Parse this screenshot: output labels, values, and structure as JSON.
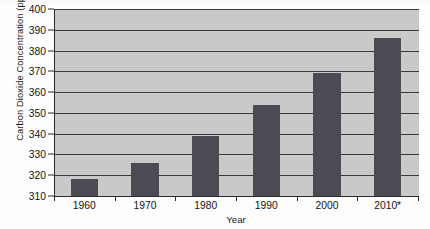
{
  "chart_data": {
    "type": "bar",
    "title": "",
    "xlabel": "Year",
    "ylabel": "Carbon Dioxide Concentration (ppmv)",
    "categories": [
      "1960",
      "1970",
      "1980",
      "1990",
      "2000",
      "2010*"
    ],
    "values": [
      318,
      326,
      339,
      354,
      369,
      386
    ],
    "ylim": [
      310,
      400
    ],
    "yticks": [
      310,
      320,
      330,
      340,
      350,
      360,
      370,
      380,
      390,
      400
    ],
    "ytick_labels": [
      "310",
      "320",
      "330",
      "340",
      "350",
      "360",
      "370",
      "380",
      "390",
      "400"
    ],
    "grid": true,
    "grid_axis": "y",
    "legend": false,
    "series": [
      {
        "name": "Carbon Dioxide Concentration",
        "values": [
          318,
          326,
          339,
          354,
          369,
          386
        ]
      }
    ],
    "colors": {
      "bar": "#4b4b53",
      "plot_background": "#c9c9c9",
      "gridline": "#3a3a3a",
      "axis": "#2a2a2a",
      "figure_background": "#fdfdfd",
      "text": "#141414"
    }
  }
}
